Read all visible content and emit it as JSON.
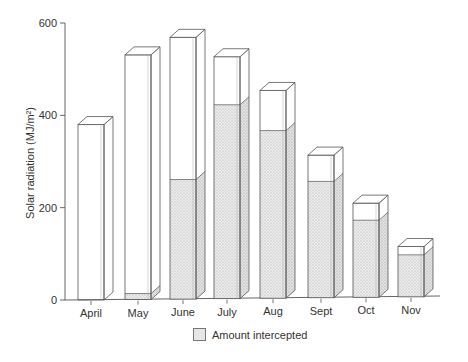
{
  "chart_data": {
    "type": "bar",
    "style": "3d-stacked-overlay",
    "title": "",
    "xlabel": "",
    "ylabel": "Solar radiation (MJ/m²)",
    "ylim": [
      0,
      600
    ],
    "yticks": [
      0,
      200,
      400,
      600
    ],
    "grid": false,
    "legend_position": "bottom-center",
    "categories": [
      "April",
      "May",
      "June",
      "July",
      "Aug",
      "Sept",
      "Oct",
      "Nov"
    ],
    "series": [
      {
        "name": "Total solar radiation",
        "values": [
          380,
          530,
          567,
          524,
          450,
          309,
          204,
          109
        ],
        "fill": "none",
        "in_legend": false
      },
      {
        "name": "Amount intercepted",
        "values": [
          0,
          13,
          259,
          420,
          363,
          252,
          167,
          91
        ],
        "fill": "stippled-grey",
        "in_legend": true
      }
    ]
  },
  "legend": {
    "label": "Amount intercepted"
  },
  "axis": {
    "ylabel": "Solar radiation (MJ/m²)"
  }
}
